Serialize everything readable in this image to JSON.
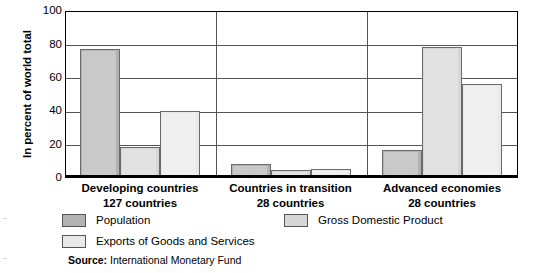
{
  "chart_data": {
    "type": "bar",
    "title": "",
    "xlabel": "",
    "ylabel": "In percent of world total",
    "ylim": [
      0,
      100
    ],
    "yticks": [
      100,
      80,
      60,
      40,
      20,
      0
    ],
    "grid": true,
    "legend_position": "bottom",
    "categories": [
      "Developing countries",
      "Countries in transition",
      "Advanced economies"
    ],
    "category_sublabels": [
      "127 countries",
      "28 countries",
      "28 countries"
    ],
    "series": [
      {
        "name": "Population",
        "color": "#b2b2b2",
        "values": [
          77,
          6.5,
          15
        ]
      },
      {
        "name": "Gross Domestic Product",
        "color": "#d6d6d6",
        "values": [
          17,
          3,
          78
        ]
      },
      {
        "name": "Exports of Goods and Services",
        "color": "#e9e9e9",
        "values": [
          39,
          3.5,
          55.5
        ]
      }
    ],
    "source_prefix": "Source:",
    "source_text": "International Monetary Fund"
  },
  "axis": {
    "y_title": "In percent of world total",
    "ticks": [
      "100",
      "80",
      "60",
      "40",
      "20",
      "0"
    ]
  },
  "categories": [
    {
      "line1": "Developing countries",
      "line2": "127 countries"
    },
    {
      "line1": "Countries in transition",
      "line2": "28 countries"
    },
    {
      "line1": "Advanced economies",
      "line2": "28 countries"
    }
  ],
  "legend": {
    "items": [
      {
        "label": "Population",
        "color": "#b2b2b2"
      },
      {
        "label": "Gross Domestic Product",
        "color": "#d6d6d6"
      },
      {
        "label": "Exports of Goods and Services",
        "color": "#e9e9e9"
      }
    ]
  },
  "source": {
    "prefix": "Source:",
    "text": " International Monetary Fund"
  }
}
